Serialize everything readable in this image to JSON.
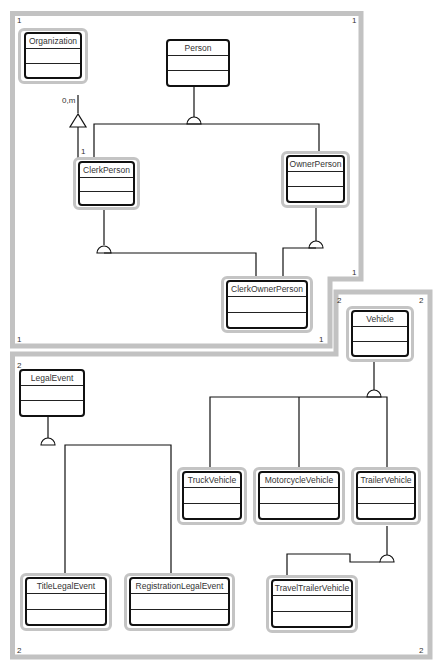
{
  "diagram": {
    "type": "uml-class-diagram",
    "regions": [
      {
        "id": "1",
        "corner_labels": {
          "top_left": "1",
          "top_right": "1",
          "notch": "1",
          "bottom_left": "1",
          "bottom_right": "1"
        }
      },
      {
        "id": "2",
        "corner_labels": {
          "top_left": "2",
          "notch_left": "2",
          "top_right": "2",
          "bottom_left": "2",
          "bottom_right": "2"
        }
      }
    ],
    "classes": {
      "organization": {
        "name": "Organization"
      },
      "person": {
        "name": "Person"
      },
      "clerk_person": {
        "name": "ClerkPerson"
      },
      "owner_person": {
        "name": "OwnerPerson"
      },
      "clerk_owner_person": {
        "name": "ClerkOwnerPerson"
      },
      "vehicle": {
        "name": "Vehicle"
      },
      "legal_event": {
        "name": "LegalEvent"
      },
      "truck_vehicle": {
        "name": "TruckVehicle"
      },
      "motorcycle_vehicle": {
        "name": "MotorcycleVehicle"
      },
      "trailer_vehicle": {
        "name": "TrailerVehicle"
      },
      "title_legal_event": {
        "name": "TitleLegalEvent"
      },
      "registration_legal_event": {
        "name": "RegistrationLegalEvent"
      },
      "travel_trailer_vehicle": {
        "name": "TravelTrailerVehicle"
      }
    },
    "relationships": [
      {
        "type": "aggregation",
        "from": "ClerkPerson",
        "to": "Organization",
        "multiplicity_to": "0,m",
        "multiplicity_from": "1"
      },
      {
        "type": "generalization",
        "parent": "Person",
        "children": [
          "ClerkPerson",
          "OwnerPerson"
        ]
      },
      {
        "type": "generalization",
        "parent": "ClerkPerson",
        "children": [
          "ClerkOwnerPerson"
        ]
      },
      {
        "type": "generalization",
        "parent": "OwnerPerson",
        "children": [
          "ClerkOwnerPerson"
        ]
      },
      {
        "type": "generalization",
        "parent": "Vehicle",
        "children": [
          "TruckVehicle",
          "MotorcycleVehicle",
          "TrailerVehicle"
        ]
      },
      {
        "type": "generalization",
        "parent": "TrailerVehicle",
        "children": [
          "TravelTrailerVehicle"
        ]
      },
      {
        "type": "generalization",
        "parent": "LegalEvent",
        "children": [
          "TitleLegalEvent",
          "RegistrationLegalEvent"
        ]
      }
    ],
    "multiplicity_labels": {
      "org_end": "0,m",
      "clerk_end": "1"
    }
  }
}
